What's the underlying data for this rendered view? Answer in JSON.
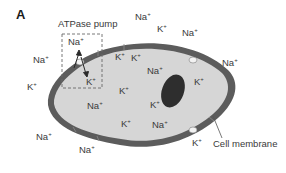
{
  "figure": {
    "panel_letter": "A",
    "pump_label": "ATPase pump",
    "membrane_label": "Cell membrane",
    "colors": {
      "membrane": "#5c5c5c",
      "cytoplasm": "#d6d6d6",
      "nucleus": "#2e2e2e",
      "pump_channel": "#f2f2f2",
      "text": "#3a3a3a",
      "dashed_box": "#6a6a6a"
    },
    "ions": [
      {
        "id": "na-pump-out",
        "base": "Na",
        "charge": "+",
        "x": 68,
        "y": 45,
        "region": "extracellular"
      },
      {
        "id": "k-pump-in",
        "base": "K",
        "charge": "+",
        "x": 86,
        "y": 85,
        "region": "intracellular"
      },
      {
        "id": "na-ext-left-top",
        "base": "Na",
        "charge": "+",
        "x": 33,
        "y": 63,
        "region": "extracellular"
      },
      {
        "id": "k-ext-left",
        "base": "K",
        "charge": "+",
        "x": 27,
        "y": 90,
        "region": "extracellular"
      },
      {
        "id": "na-ext-top",
        "base": "Na",
        "charge": "+",
        "x": 135,
        "y": 20,
        "region": "extracellular"
      },
      {
        "id": "k-ext-top",
        "base": "K",
        "charge": "+",
        "x": 157,
        "y": 32,
        "region": "extracellular"
      },
      {
        "id": "na-ext-top-right",
        "base": "Na",
        "charge": "+",
        "x": 182,
        "y": 36,
        "region": "extracellular"
      },
      {
        "id": "na-ext-right",
        "base": "Na",
        "charge": "+",
        "x": 222,
        "y": 66,
        "region": "extracellular"
      },
      {
        "id": "k-int-1",
        "base": "K",
        "charge": "+",
        "x": 115,
        "y": 60,
        "region": "intracellular"
      },
      {
        "id": "k-int-2",
        "base": "K",
        "charge": "+",
        "x": 131,
        "y": 61,
        "region": "intracellular"
      },
      {
        "id": "na-int-1",
        "base": "Na",
        "charge": "+",
        "x": 147,
        "y": 74,
        "region": "intracellular"
      },
      {
        "id": "k-int-3",
        "base": "K",
        "charge": "+",
        "x": 194,
        "y": 85,
        "region": "intracellular"
      },
      {
        "id": "k-int-4",
        "base": "K",
        "charge": "+",
        "x": 119,
        "y": 94,
        "region": "intracellular"
      },
      {
        "id": "na-int-2",
        "base": "Na",
        "charge": "+",
        "x": 87,
        "y": 109,
        "region": "intracellular"
      },
      {
        "id": "k-int-5",
        "base": "K",
        "charge": "+",
        "x": 150,
        "y": 108,
        "region": "intracellular"
      },
      {
        "id": "k-int-6",
        "base": "K",
        "charge": "+",
        "x": 121,
        "y": 127,
        "region": "intracellular"
      },
      {
        "id": "na-int-3",
        "base": "Na",
        "charge": "+",
        "x": 152,
        "y": 128,
        "region": "intracellular"
      },
      {
        "id": "na-ext-bottom-left",
        "base": "Na",
        "charge": "+",
        "x": 36,
        "y": 140,
        "region": "extracellular"
      },
      {
        "id": "na-ext-bottom",
        "base": "Na",
        "charge": "+",
        "x": 79,
        "y": 153,
        "region": "extracellular"
      },
      {
        "id": "k-ext-bottom-right",
        "base": "K",
        "charge": "+",
        "x": 192,
        "y": 146,
        "region": "extracellular"
      }
    ]
  }
}
